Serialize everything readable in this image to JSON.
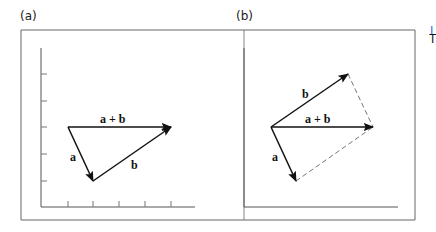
{
  "panels": [
    {
      "id": "a",
      "label": "(a)",
      "vectors": [
        {
          "name": "a",
          "label": "a",
          "from": [
            68,
            127
          ],
          "to": [
            93,
            181
          ],
          "style": "solid"
        },
        {
          "name": "b",
          "label": "b",
          "from": [
            93,
            181
          ],
          "to": [
            171,
            127
          ],
          "style": "solid"
        },
        {
          "name": "a+b",
          "label": "a + b",
          "from": [
            68,
            127
          ],
          "to": [
            171,
            127
          ],
          "style": "solid"
        }
      ],
      "axes": {
        "y_ticks": 5,
        "x_ticks": 5
      }
    },
    {
      "id": "b",
      "label": "(b)",
      "vectors": [
        {
          "name": "a",
          "label": "a",
          "from": [
            271,
            127
          ],
          "to": [
            296,
            181
          ],
          "style": "solid"
        },
        {
          "name": "b",
          "label": "b",
          "from": [
            271,
            127
          ],
          "to": [
            348,
            74
          ],
          "style": "solid"
        },
        {
          "name": "a+b",
          "label": "a + b",
          "from": [
            271,
            127
          ],
          "to": [
            373,
            127
          ],
          "style": "solid"
        },
        {
          "name": "b-parallel",
          "label": "",
          "from": [
            296,
            181
          ],
          "to": [
            373,
            127
          ],
          "style": "dashed"
        },
        {
          "name": "a-parallel",
          "label": "",
          "from": [
            348,
            74
          ],
          "to": [
            373,
            127
          ],
          "style": "dashed"
        }
      ],
      "axes": {
        "y_ticks": 0,
        "x_ticks": 0
      }
    }
  ],
  "labels": {
    "panel_a": "(a)",
    "panel_b": "(b)",
    "a_sum": "a + b",
    "a_a": "a",
    "a_b": "b",
    "b_sum": "a + b",
    "b_a": "a",
    "b_b": "b"
  },
  "edge_text": {
    "clipped_link": "I",
    "clipped_char": "T"
  },
  "colors": {
    "line": "#111111",
    "frame": "#555555",
    "dashed": "#777777",
    "link": "#1a73e8"
  }
}
